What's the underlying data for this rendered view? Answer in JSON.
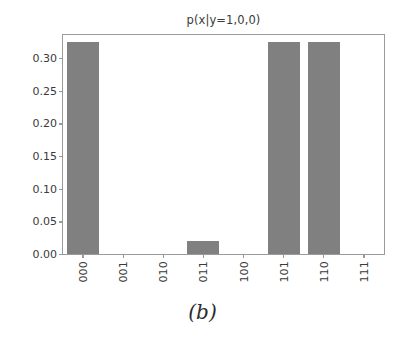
{
  "figure": {
    "caption": "(b)",
    "background_color": "#ffffff"
  },
  "chart_data": {
    "type": "bar",
    "title": "p(x|y=1,0,0)",
    "xlabel": "",
    "ylabel": "",
    "categories": [
      "000",
      "001",
      "010",
      "011",
      "100",
      "101",
      "110",
      "111"
    ],
    "values": [
      0.325,
      0.0,
      0.0,
      0.02,
      0.0,
      0.325,
      0.325,
      0.0
    ],
    "ylim": [
      0.0,
      0.3353
    ],
    "xlim": [
      -0.5,
      7.5
    ],
    "yticks": [
      0.0,
      0.05,
      0.1,
      0.15,
      0.2,
      0.25,
      0.3
    ],
    "ytick_labels": [
      "0.00",
      "0.05",
      "0.10",
      "0.15",
      "0.20",
      "0.25",
      "0.30"
    ],
    "xtick_labels": [
      "000",
      "001",
      "010",
      "011",
      "100",
      "101",
      "110",
      "111"
    ],
    "xtick_rotation": 90,
    "grid": false,
    "legend": null,
    "bar_color": "#808080",
    "bar_width_ratio": 0.8,
    "axis_color": "#9a9a9a",
    "text_color": "#3a3a3a"
  }
}
